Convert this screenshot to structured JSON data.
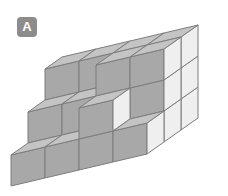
{
  "figure": {
    "label": "A",
    "title": "A",
    "kind": "isometric-cube-stack",
    "background_color": "#ffffff"
  },
  "badge": {
    "text": "A",
    "background_color": "#8c8c8c",
    "text_color": "#ffffff"
  },
  "palette": {
    "top_face": "#c4c4c4",
    "left_face": "#a8a8a8",
    "right_face": "#efefef",
    "edge_stroke": "#7d7d7d",
    "badge_gray": "#8c8c8c"
  },
  "geometry": {
    "origin_x": 11,
    "origin_y": 186,
    "unit_x_dx": 34,
    "unit_x_dy": -8,
    "unit_y_dx": 17,
    "unit_y_dy": -12,
    "unit_z_dy": -31,
    "grid_cols": 4,
    "grid_rows": 3,
    "grid_levels": 3
  },
  "chart_data": {
    "type": "table",
    "xlabel": "column (x)",
    "ylabel": "depth (y)",
    "columns": [
      "x",
      "y",
      "height"
    ],
    "rows": [
      [
        0,
        0,
        1
      ],
      [
        1,
        0,
        1
      ],
      [
        2,
        0,
        2
      ],
      [
        3,
        0,
        1
      ],
      [
        0,
        1,
        2
      ],
      [
        1,
        1,
        2
      ],
      [
        2,
        1,
        3
      ],
      [
        3,
        1,
        3
      ],
      [
        0,
        2,
        3
      ],
      [
        1,
        2,
        3
      ],
      [
        2,
        2,
        3
      ],
      [
        3,
        2,
        3
      ]
    ],
    "total_cubes": 25,
    "note": "Column heights of the stacked unit cubes, front-left row first"
  }
}
